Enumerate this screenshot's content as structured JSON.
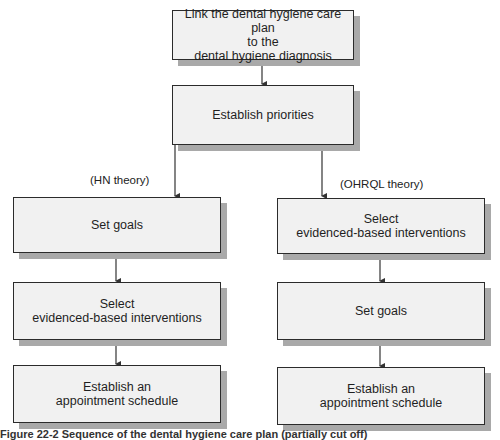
{
  "flowchart": {
    "top": {
      "lines": [
        "Link the dental hygiene care plan",
        "to the",
        "dental hygiene diagnosis"
      ]
    },
    "priorities": {
      "label": "Establish priorities"
    },
    "left_branch": {
      "label": "(HN theory)",
      "steps": [
        {
          "lines": [
            "Set goals"
          ]
        },
        {
          "lines": [
            "Select",
            "evidenced-based interventions"
          ]
        },
        {
          "lines": [
            "Establish an",
            "appointment schedule"
          ]
        }
      ]
    },
    "right_branch": {
      "label": "(OHRQL theory)",
      "steps": [
        {
          "lines": [
            "Select",
            "evidenced-based interventions"
          ]
        },
        {
          "lines": [
            "Set goals"
          ]
        },
        {
          "lines": [
            "Establish an",
            "appointment schedule"
          ]
        }
      ]
    }
  },
  "caption": "Figure 22-2 Sequence of the dental hygiene care plan (partially cut off)",
  "colors": {
    "box_fill": "#f1f1f1",
    "box_border": "#2b2b2b",
    "box_shadow": "#a9a9a9",
    "arrow": "#333333"
  }
}
